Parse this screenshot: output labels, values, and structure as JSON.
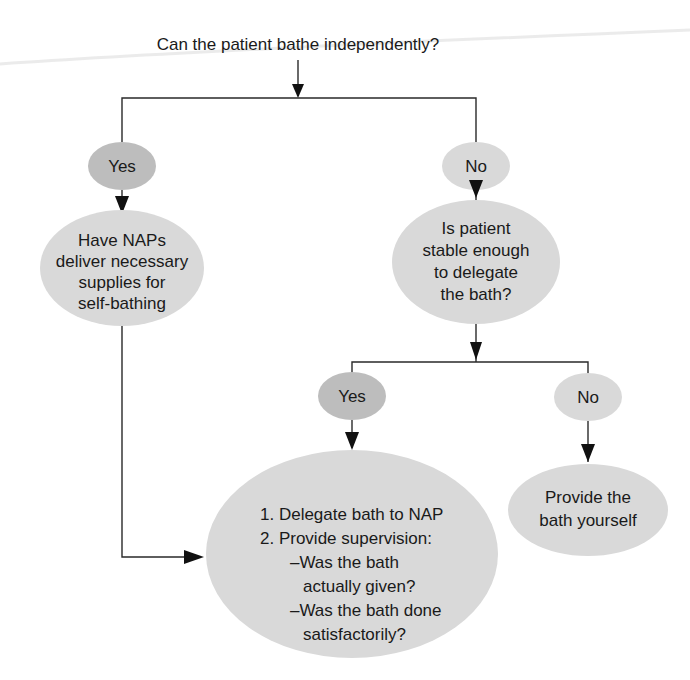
{
  "diagram": {
    "type": "decision-flowchart",
    "title": "Can the patient bathe independently?",
    "colors": {
      "oval_fill": "#d9d9d9",
      "oval_fill_dark": "#bdbdbd",
      "line": "#2a2a2a",
      "text": "#1a1a1a"
    },
    "nodes": {
      "yes1": {
        "label": "Yes"
      },
      "no1": {
        "label": "No"
      },
      "have_naps": {
        "lines": [
          "Have NAPs",
          "deliver necessary",
          "supplies for",
          "self-bathing"
        ]
      },
      "is_stable": {
        "lines": [
          "Is patient",
          "stable enough",
          "to delegate",
          "the bath?"
        ]
      },
      "yes2": {
        "label": "Yes"
      },
      "no2": {
        "label": "No"
      },
      "delegate": {
        "lines": [
          "1. Delegate bath to NAP",
          "2. Provide supervision:",
          "–Was the bath",
          "actually given?",
          "–Was the bath done",
          "satisfactorily?"
        ]
      },
      "provide": {
        "lines": [
          "Provide the",
          "bath yourself"
        ]
      }
    },
    "edges": [
      {
        "from": "title",
        "to": "branch1"
      },
      {
        "from": "branch1",
        "to": "yes1"
      },
      {
        "from": "branch1",
        "to": "no1"
      },
      {
        "from": "yes1",
        "to": "have_naps"
      },
      {
        "from": "no1",
        "to": "is_stable"
      },
      {
        "from": "is_stable",
        "to": "branch2"
      },
      {
        "from": "branch2",
        "to": "yes2"
      },
      {
        "from": "branch2",
        "to": "no2"
      },
      {
        "from": "yes2",
        "to": "delegate"
      },
      {
        "from": "no2",
        "to": "provide"
      },
      {
        "from": "have_naps",
        "to": "delegate"
      }
    ]
  }
}
